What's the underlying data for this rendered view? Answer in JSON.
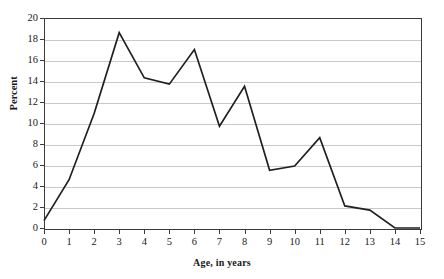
{
  "chart_data": {
    "type": "line",
    "title": "",
    "xlabel": "Age, in years",
    "ylabel": "Percent",
    "x": [
      0,
      1,
      2,
      3,
      4,
      5,
      6,
      7,
      8,
      9,
      10,
      11,
      12,
      13,
      14,
      15
    ],
    "values": [
      0.7,
      4.6,
      10.9,
      18.6,
      14.3,
      13.7,
      17.0,
      9.7,
      13.5,
      5.5,
      5.9,
      8.6,
      2.1,
      1.7,
      0.0,
      0.0
    ],
    "series": [
      {
        "name": "Percent",
        "values": [
          0.7,
          4.6,
          10.9,
          18.6,
          14.3,
          13.7,
          17.0,
          9.7,
          13.5,
          5.5,
          5.9,
          8.6,
          2.1,
          1.7,
          0.0,
          0.0
        ]
      }
    ],
    "xlim": [
      0,
      15
    ],
    "ylim": [
      0,
      20
    ],
    "xticks": [
      "0",
      "1",
      "2",
      "3",
      "4",
      "5",
      "6",
      "7",
      "8",
      "9",
      "10",
      "11",
      "12",
      "13",
      "14",
      "15"
    ],
    "yticks": [
      "0",
      "2",
      "4",
      "6",
      "8",
      "10",
      "12",
      "14",
      "16",
      "18",
      "20"
    ],
    "ytick_values": [
      0,
      2,
      4,
      6,
      8,
      10,
      12,
      14,
      16,
      18,
      20
    ],
    "grid": "horizontal",
    "legend": "none",
    "line_color": "#231f20",
    "grid_color": "#c9c9c9",
    "axis_color": "#3a3a3a",
    "background": "#ffffff"
  }
}
